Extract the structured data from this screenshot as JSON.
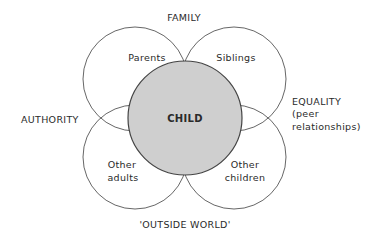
{
  "diagram": {
    "center": {
      "label": "CHILD",
      "fill": "#cfcfcf",
      "stroke": "#444444"
    },
    "circles": [
      {
        "label": "Parents"
      },
      {
        "label": "Siblings"
      },
      {
        "label_line1": "Other",
        "label_line2": "adults"
      },
      {
        "label_line1": "Other",
        "label_line2": "children"
      }
    ],
    "axes": {
      "top": "FAMILY",
      "left": "AUTHORITY",
      "right_line1": "EQUALITY",
      "right_line2": "(peer",
      "right_line3": "relationships)",
      "bottom": "'OUTSIDE WORLD'"
    }
  }
}
